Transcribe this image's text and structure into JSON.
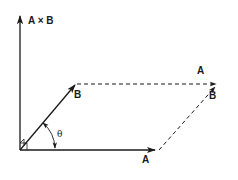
{
  "diagram": {
    "labels": {
      "cross_product": "A × B",
      "vector_a": "A",
      "vector_b": "B",
      "vector_a_translated": "A",
      "vector_b_translated": "B",
      "angle": "θ"
    },
    "colors": {
      "stroke": "#1a1a1a",
      "background": "#ffffff"
    },
    "vectors": [
      {
        "name": "A",
        "from": [
          20,
          150
        ],
        "to": [
          157,
          150
        ],
        "style": "solid"
      },
      {
        "name": "B",
        "from": [
          20,
          150
        ],
        "to": [
          76,
          84
        ],
        "style": "solid"
      },
      {
        "name": "A x B",
        "from": [
          20,
          150
        ],
        "to": [
          20,
          14
        ],
        "style": "solid"
      },
      {
        "name": "A (translated)",
        "from": [
          76,
          84
        ],
        "to": [
          218,
          84
        ],
        "style": "dashed"
      },
      {
        "name": "B (translated)",
        "from": [
          157,
          150
        ],
        "to": [
          216,
          86
        ],
        "style": "dashed"
      }
    ]
  }
}
